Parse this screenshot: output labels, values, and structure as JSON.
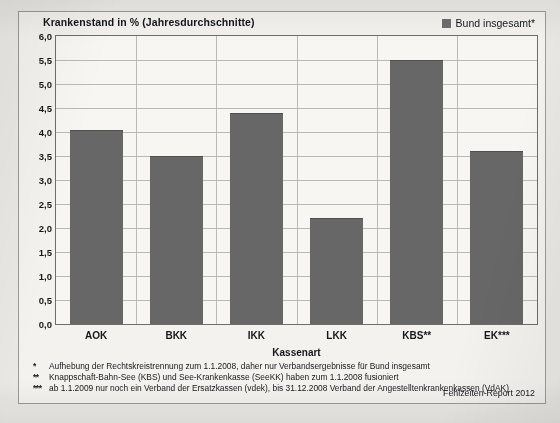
{
  "chart_data": {
    "type": "bar",
    "title": "Krankenstand in %  (Jahresdurchschnitte)",
    "xlabel": "Kassenart",
    "ylabel": "",
    "categories": [
      "AOK",
      "BKK",
      "IKK",
      "LKK",
      "KBS**",
      "EK***"
    ],
    "values": [
      4.05,
      3.5,
      4.4,
      2.2,
      5.5,
      3.6
    ],
    "series": [
      {
        "name": "Bund insgesamt*",
        "values": [
          4.05,
          3.5,
          4.4,
          2.2,
          5.5,
          3.6
        ]
      }
    ],
    "ylim": [
      0.0,
      6.0
    ],
    "ytick_step": 0.5,
    "ytick_labels": [
      "6,0",
      "5,5",
      "5,0",
      "4,5",
      "4,0",
      "3,5",
      "3,0",
      "2,5",
      "2,0",
      "1,5",
      "1,0",
      "0,5",
      "0,0"
    ],
    "ytick_values": [
      6.0,
      5.5,
      5.0,
      4.5,
      4.0,
      3.5,
      3.0,
      2.5,
      2.0,
      1.5,
      1.0,
      0.5,
      0.0
    ],
    "grid": true,
    "grid_axes": "both",
    "legend_position": "top-right",
    "bar_color": "#676767",
    "plot_background": "#f7f6f3",
    "figure_background": "#f3f2ef"
  },
  "header": {
    "title": "Krankenstand in %  (Jahresdurchschnitte)"
  },
  "legend": {
    "swatch_color": "#6e6e6e",
    "label": "Bund insgesamt*"
  },
  "axes": {
    "x_title": "Kassenart"
  },
  "footnotes": [
    {
      "marker": "*",
      "text": "Aufhebung der Rechtskreistrennung zum 1.1.2008, daher nur Verbandsergebnisse für Bund insgesamt"
    },
    {
      "marker": "**",
      "text": "Knappschaft-Bahn-See (KBS) und See-Krankenkasse (SeeKK) haben zum 1.1.2008 fusioniert"
    },
    {
      "marker": "***",
      "text": "ab 1.1.2009 nur noch ein Verband der Ersatzkassen (vdek), bis 31.12.2008 Verband der Angestelltenkrankenkassen (VdAK)"
    }
  ],
  "source": {
    "label": "Fehlzeiten-Report 2012"
  }
}
